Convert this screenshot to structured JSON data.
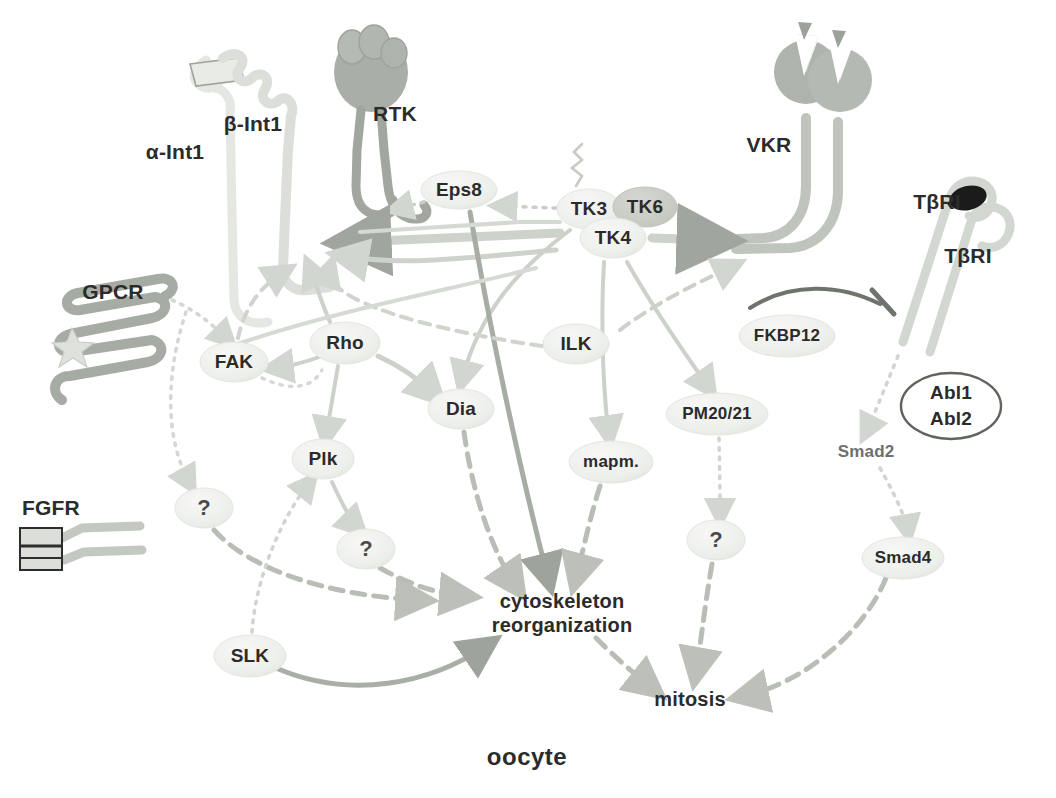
{
  "figure": {
    "cell_label": "oocyte",
    "background": "#ffffff"
  },
  "palette": {
    "pale_node_fill": "#eef0ec",
    "pale_node_stroke": "#dfe2dd",
    "dark_node_fill": "#c9cec7",
    "receptor_light": "#d8dcd6",
    "receptor_mid": "#aab0a8",
    "receptor_dark": "#8a8f88",
    "arrow_pale": "#d2d6d0",
    "arrow_mid": "#b9bdb6",
    "arrow_dark": "#9aa097",
    "text_dark": "#2b2b2b",
    "text_faint": "#6f6f6f",
    "black": "#161616"
  },
  "receptors": [
    {
      "id": "alpha-int1",
      "label": "α-Int1",
      "x": 175,
      "y": 152,
      "tone": "very-light"
    },
    {
      "id": "beta-int1",
      "label": "β-Int1",
      "x": 253,
      "y": 124,
      "tone": "very-light"
    },
    {
      "id": "rtk",
      "label": "RTK",
      "x": 395,
      "y": 114,
      "tone": "dark"
    },
    {
      "id": "vkr",
      "label": "VKR",
      "x": 769,
      "y": 145,
      "tone": "mid"
    },
    {
      "id": "tbri-1",
      "label": "TβRI",
      "x": 937,
      "y": 202,
      "tone": "light"
    },
    {
      "id": "tbri-2",
      "label": "TβRI",
      "x": 968,
      "y": 256,
      "tone": "light"
    },
    {
      "id": "gpcr",
      "label": "GPCR",
      "x": 113,
      "y": 292,
      "tone": "mid"
    },
    {
      "id": "fgfr",
      "label": "FGFR",
      "x": 51,
      "y": 508,
      "tone": "mid"
    }
  ],
  "nodes": [
    {
      "id": "eps8",
      "label": "Eps8",
      "x": 459,
      "y": 190,
      "rx": 38,
      "ry": 19,
      "shade": "pale"
    },
    {
      "id": "tk3",
      "label": "TK3",
      "x": 589,
      "y": 209,
      "rx": 32,
      "ry": 20,
      "shade": "pale"
    },
    {
      "id": "tk6",
      "label": "TK6",
      "x": 645,
      "y": 207,
      "rx": 32,
      "ry": 20,
      "shade": "dark"
    },
    {
      "id": "tk4",
      "label": "TK4",
      "x": 613,
      "y": 238,
      "rx": 33,
      "ry": 20,
      "shade": "pale"
    },
    {
      "id": "fakk",
      "label": "FAK",
      "x": 234,
      "y": 362,
      "rx": 34,
      "ry": 20,
      "shade": "pale"
    },
    {
      "id": "rho",
      "label": "Rho",
      "x": 345,
      "y": 343,
      "rx": 35,
      "ry": 21,
      "shade": "pale"
    },
    {
      "id": "ilk",
      "label": "ILK",
      "x": 576,
      "y": 344,
      "rx": 33,
      "ry": 20,
      "shade": "pale"
    },
    {
      "id": "fkbp12",
      "label": "FKBP12",
      "x": 787,
      "y": 336,
      "rx": 48,
      "ry": 21,
      "shade": "pale"
    },
    {
      "id": "dia",
      "label": "Dia",
      "x": 461,
      "y": 409,
      "rx": 33,
      "ry": 20,
      "shade": "pale"
    },
    {
      "id": "pm2021",
      "label": "PM20/21",
      "x": 717,
      "y": 414,
      "rx": 51,
      "ry": 21,
      "shade": "pale"
    },
    {
      "id": "smad2",
      "label": "Smad2",
      "x": 866,
      "y": 452,
      "rx": 0,
      "ry": 0,
      "shade": "none"
    },
    {
      "id": "plk",
      "label": "Plk",
      "x": 323,
      "y": 459,
      "rx": 31,
      "ry": 20,
      "shade": "pale"
    },
    {
      "id": "mapm",
      "label": "mapm.",
      "x": 611,
      "y": 462,
      "rx": 42,
      "ry": 21,
      "shade": "pale"
    },
    {
      "id": "q1",
      "label": "?",
      "x": 204,
      "y": 508,
      "rx": 29,
      "ry": 20,
      "shade": "pale"
    },
    {
      "id": "q2",
      "label": "?",
      "x": 366,
      "y": 549,
      "rx": 29,
      "ry": 20,
      "shade": "pale"
    },
    {
      "id": "q3",
      "label": "?",
      "x": 716,
      "y": 540,
      "rx": 29,
      "ry": 20,
      "shade": "pale"
    },
    {
      "id": "smad4",
      "label": "Smad4",
      "x": 903,
      "y": 558,
      "rx": 41,
      "ry": 21,
      "shade": "pale"
    },
    {
      "id": "slk",
      "label": "SLK",
      "x": 250,
      "y": 656,
      "rx": 36,
      "ry": 21,
      "shade": "pale"
    },
    {
      "id": "abl",
      "label_line1": "Abl1",
      "label_line2": "Abl2",
      "x": 951,
      "y": 406,
      "rx": 50,
      "ry": 33,
      "shade": "outline"
    }
  ],
  "outcomes": [
    {
      "id": "cytoskeleton",
      "line1": "cytoskeleton",
      "line2": "reorganization",
      "x": 562,
      "y": 613
    },
    {
      "id": "mitosis",
      "line1": "mitosis",
      "line2": "",
      "x": 690,
      "y": 700
    }
  ],
  "edges": [
    {
      "from": "tk3",
      "to": "eps8",
      "style": "dotted"
    },
    {
      "from": "tk3",
      "to": "beta-int1",
      "style": "solid"
    },
    {
      "from": "tk4",
      "to": "vkr",
      "style": "solid"
    },
    {
      "from": "tk4",
      "to": "tbri",
      "style": "dashed"
    },
    {
      "from": "tk4",
      "to": "mapm",
      "style": "solid"
    },
    {
      "from": "tk4",
      "to": "pm2021",
      "style": "solid"
    },
    {
      "from": "tk3",
      "to": "dia",
      "style": "solid"
    },
    {
      "from": "eps8",
      "to": "cytoskeleton",
      "style": "solid"
    },
    {
      "from": "ilk",
      "to": "integrin",
      "style": "dashed"
    },
    {
      "from": "gpcr",
      "to": "fak",
      "style": "dotted"
    },
    {
      "from": "fak",
      "to": "integrin",
      "style": "dashed"
    },
    {
      "from": "rho",
      "to": "dia",
      "style": "solid"
    },
    {
      "from": "rho",
      "to": "plk",
      "style": "solid"
    },
    {
      "from": "rho",
      "to": "integrin",
      "style": "solid"
    },
    {
      "from": "dia",
      "to": "cytoskeleton",
      "style": "dashed"
    },
    {
      "from": "plk",
      "to": "q2",
      "style": "solid"
    },
    {
      "from": "q1",
      "to": "cytoskeleton",
      "style": "dashed"
    },
    {
      "from": "q2",
      "to": "cytoskeleton",
      "style": "dashed"
    },
    {
      "from": "slk",
      "to": "cytoskeleton",
      "style": "solid"
    },
    {
      "from": "slk",
      "to": "plk",
      "style": "dotted"
    },
    {
      "from": "mapm",
      "to": "cytoskeleton",
      "style": "dashed"
    },
    {
      "from": "pm2021",
      "to": "q3",
      "style": "dotted"
    },
    {
      "from": "q3",
      "to": "mitosis",
      "style": "dashed"
    },
    {
      "from": "cytoskeleton",
      "to": "mitosis",
      "style": "dashed"
    },
    {
      "from": "tbri",
      "to": "smad2",
      "style": "dotted"
    },
    {
      "from": "smad2",
      "to": "smad4",
      "style": "dotted"
    },
    {
      "from": "smad4",
      "to": "mitosis",
      "style": "dashed"
    },
    {
      "from": "fkbp12",
      "to": "tbri",
      "style": "inhibit"
    }
  ]
}
